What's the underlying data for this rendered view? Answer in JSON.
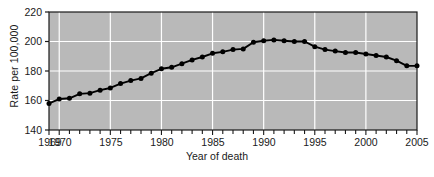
{
  "chart_data": {
    "type": "line",
    "title": "",
    "xlabel": "Year of death",
    "ylabel": "Rate per 100,000",
    "xlim": [
      1969,
      2005
    ],
    "ylim": [
      140,
      220
    ],
    "yticks": [
      140,
      160,
      180,
      200,
      220
    ],
    "xticks_labeled": [
      1969,
      1970,
      1975,
      1980,
      1985,
      1990,
      1995,
      2000,
      2005
    ],
    "xtick_step_minor": 1,
    "grid": "white gridlines on gray plot background",
    "legend": "none",
    "marker": "filled circle",
    "x": [
      1969,
      1970,
      1971,
      1972,
      1973,
      1974,
      1975,
      1976,
      1977,
      1978,
      1979,
      1980,
      1981,
      1982,
      1983,
      1984,
      1985,
      1986,
      1987,
      1988,
      1989,
      1990,
      1991,
      1992,
      1993,
      1994,
      1995,
      1996,
      1997,
      1998,
      1999,
      2000,
      2001,
      2002,
      2003,
      2004,
      2005
    ],
    "values": [
      158.0,
      161.0,
      161.5,
      164.5,
      165.0,
      167.0,
      168.5,
      171.5,
      173.5,
      175.0,
      178.5,
      181.5,
      182.5,
      185.0,
      187.5,
      189.5,
      192.0,
      193.0,
      194.5,
      195.0,
      199.5,
      200.5,
      201.0,
      200.5,
      200.0,
      200.0,
      196.5,
      194.5,
      193.5,
      192.5,
      192.5,
      191.5,
      190.5,
      189.5,
      187.0,
      183.5,
      183.5
    ],
    "plot_bg_color": "#b9b9b9",
    "gridline_color": "#ffffff",
    "line_color": "#000000",
    "axis_color": "#1a1a1a"
  },
  "axes": {
    "ylabel": "Rate per 100,000",
    "xlabel": "Year of death",
    "ytick_labels": [
      "220",
      "200",
      "180",
      "160",
      "140"
    ],
    "xtick_labels": [
      "1969",
      "1970",
      "1975",
      "1980",
      "1985",
      "1990",
      "1995",
      "2000",
      "2005"
    ]
  }
}
